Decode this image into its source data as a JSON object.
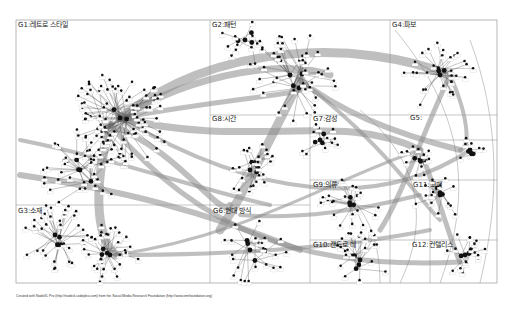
{
  "groups": [
    {
      "id": "G1",
      "label": "G1:레트로 스타일"
    },
    {
      "id": "G2",
      "label": "G2:패턴"
    },
    {
      "id": "G3",
      "label": "G3:소재"
    },
    {
      "id": "G4",
      "label": "G4:파보"
    },
    {
      "id": "G5",
      "label": "G5:"
    },
    {
      "id": "G6",
      "label": "G6:빈티지"
    },
    {
      "id": "G7",
      "label": "G7:감성"
    },
    {
      "id": "G8",
      "label": "G8:시간"
    },
    {
      "id": "G9",
      "label": "G9:의류"
    },
    {
      "id": "G10",
      "label": "G10:캔드로 데"
    },
    {
      "id": "G11",
      "label": "G11:고백"
    },
    {
      "id": "G12",
      "label": "G12:컨텔리스"
    },
    {
      "id": "G6b",
      "label": "G6:현대 방식"
    }
  ],
  "footer": "Created with NodeXL Pro (http://nodexl.codeplex.com) from the Social Media Research Foundation (http://www.smrfoundation.org)",
  "colors": {
    "bundle": "#8a8a8a",
    "edge": "#555555",
    "node": "#111111",
    "grid": "#888888"
  }
}
